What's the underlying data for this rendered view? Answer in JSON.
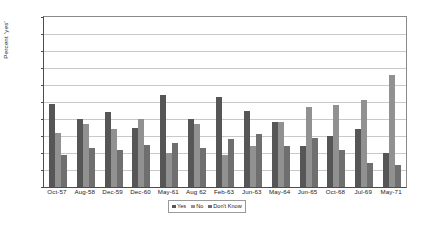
{
  "chart_data": {
    "type": "bar",
    "title": "",
    "xlabel": "",
    "ylabel": "Percent 'yes'",
    "ylim": [
      0,
      100
    ],
    "ytick_step": 10,
    "yticks": [
      0,
      10,
      20,
      30,
      40,
      50,
      60,
      70,
      80,
      90,
      100
    ],
    "grid": true,
    "legend_position": "bottom",
    "categories": [
      "Oct-57",
      "Aug-58",
      "Dec-59",
      "Dec-60",
      "May-61",
      "Aug 62",
      "Feb-63",
      "Jun-63",
      "May-64",
      "Jun-65",
      "Oct-68",
      "Jul-69",
      "May-71"
    ],
    "series": [
      {
        "name": "Yes",
        "color": "#565656",
        "values": [
          49,
          40,
          44,
          35,
          54,
          40,
          53,
          45,
          38,
          24,
          30,
          34,
          20
        ]
      },
      {
        "name": "No",
        "color": "#919191",
        "values": [
          32,
          37,
          34,
          40,
          20,
          37,
          19,
          24,
          38,
          47,
          48,
          51,
          66
        ]
      },
      {
        "name": "Don't Know",
        "color": "#6f6f6f",
        "values": [
          19,
          23,
          22,
          25,
          26,
          23,
          28,
          31,
          24,
          29,
          22,
          14,
          13
        ]
      }
    ]
  },
  "axis": {
    "y_title": "Percent 'yes'"
  },
  "legend": {
    "entries": [
      "Yes",
      "No",
      "Don't Know"
    ]
  }
}
